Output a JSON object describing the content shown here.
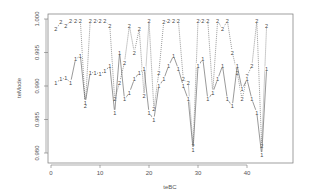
{
  "chart_data": {
    "type": "line",
    "title": "",
    "xlabel": "teBC",
    "ylabel": "teMode",
    "x_ticks": [
      0,
      10,
      20,
      30,
      40
    ],
    "y_ticks": [
      "0.980",
      "0.985",
      "0.990",
      "0.995",
      "1.000"
    ],
    "xlim": [
      -1,
      46
    ],
    "ylim": [
      0.9795,
      1.0003
    ],
    "grid": false,
    "legend": "none (points labeled with series number)",
    "x": [
      1,
      2,
      3,
      4,
      5,
      6,
      7,
      8,
      9,
      10,
      11,
      12,
      13,
      14,
      15,
      16,
      17,
      18,
      19,
      20,
      21,
      22,
      23,
      24,
      25,
      26,
      27,
      28,
      29,
      30,
      31,
      32,
      33,
      34,
      35,
      36,
      37,
      38,
      39,
      40,
      41,
      42,
      43,
      44
    ],
    "series": [
      {
        "name": "1",
        "style": "solid",
        "values": [
          0.9905,
          0.991,
          0.9912,
          0.9905,
          0.994,
          0.9945,
          0.9875,
          0.992,
          0.992,
          0.9918,
          0.9922,
          0.993,
          0.986,
          0.995,
          0.988,
          0.989,
          0.991,
          0.992,
          0.9925,
          0.986,
          0.985,
          0.99,
          0.991,
          0.993,
          0.9945,
          0.9925,
          0.99,
          0.988,
          0.9805,
          0.993,
          0.994,
          0.988,
          0.989,
          0.991,
          0.993,
          0.988,
          0.987,
          0.993,
          0.9895,
          0.991,
          0.988,
          0.986,
          0.9797,
          0.9925
        ]
      },
      {
        "name": "2",
        "style": "dotted",
        "values": [
          0.9985,
          0.9995,
          0.999,
          0.9997,
          0.9997,
          0.9997,
          0.987,
          0.9997,
          0.9997,
          0.9997,
          0.9997,
          0.999,
          0.988,
          0.9905,
          0.9935,
          0.999,
          0.995,
          0.9985,
          0.9885,
          0.9997,
          0.9865,
          0.992,
          0.9995,
          0.9997,
          0.9997,
          0.9997,
          0.991,
          0.9905,
          0.981,
          0.9997,
          0.9997,
          0.9997,
          0.989,
          0.9997,
          0.9985,
          0.9997,
          0.995,
          0.992,
          0.988,
          0.9915,
          0.993,
          0.9997,
          0.981,
          0.999
        ]
      }
    ]
  }
}
